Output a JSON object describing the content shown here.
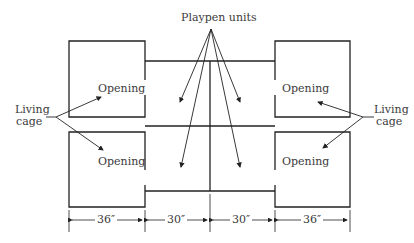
{
  "diagram": {
    "title_label": "Playpen units",
    "left_label_line1": "Living",
    "left_label_line2": "cage",
    "right_label_line1": "Living",
    "right_label_line2": "cage",
    "openings": {
      "top_left": "Opening",
      "bottom_left": "Opening",
      "top_right": "Opening",
      "bottom_right": "Opening"
    },
    "dimensions": [
      "36″",
      "30″",
      "30″",
      "36″"
    ],
    "colors": {
      "line": "#222222",
      "text": "#3a3a3a",
      "background": "#ffffff"
    }
  }
}
